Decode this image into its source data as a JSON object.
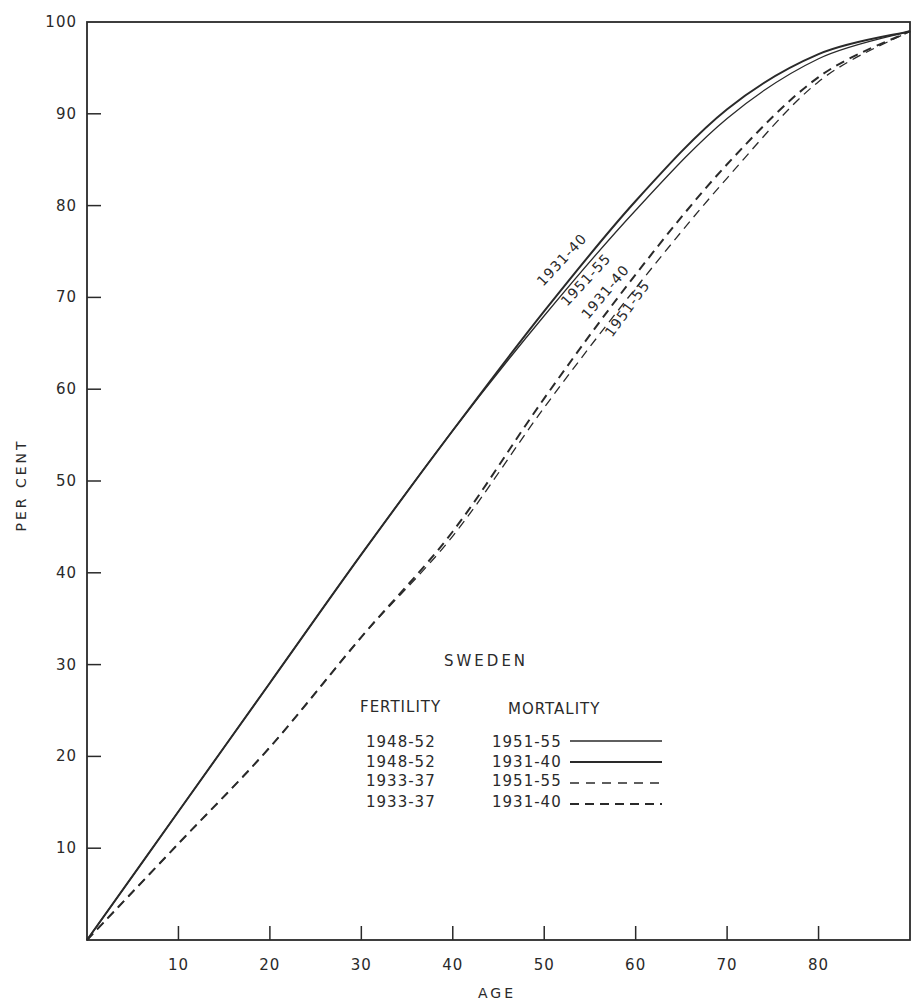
{
  "chart_data": {
    "type": "line",
    "title": "SWEDEN",
    "xlabel": "AGE",
    "ylabel": "PER CENT",
    "xlim": [
      0,
      90
    ],
    "ylim": [
      0,
      100
    ],
    "x_ticks": [
      10,
      20,
      30,
      40,
      50,
      60,
      70,
      80
    ],
    "y_ticks": [
      10,
      20,
      30,
      40,
      50,
      60,
      70,
      80,
      90,
      100
    ],
    "grid": false,
    "legend_position": "lower right inside plot",
    "legend_headers": {
      "fertility": "FERTILITY",
      "mortality": "MORTALITY"
    },
    "x": [
      0,
      10,
      20,
      30,
      40,
      50,
      60,
      70,
      80,
      90
    ],
    "series": [
      {
        "name": "Fertility 1948-52, Mortality 1951-55",
        "fertility": "1948-52",
        "mortality": "1951-55",
        "style": "solid-thin",
        "values": [
          0,
          14,
          28,
          42,
          55.5,
          68,
          79.5,
          89.5,
          96,
          99
        ]
      },
      {
        "name": "Fertility 1948-52, Mortality 1931-40",
        "fertility": "1948-52",
        "mortality": "1931-40",
        "style": "solid-thick",
        "values": [
          0,
          14,
          28,
          42,
          55.5,
          68.5,
          80.5,
          90.5,
          96.5,
          99
        ]
      },
      {
        "name": "Fertility 1933-37, Mortality 1951-55",
        "fertility": "1933-37",
        "mortality": "1951-55",
        "style": "dashed-thin",
        "values": [
          0,
          10.5,
          21,
          33,
          44,
          58,
          71,
          83,
          93.5,
          99
        ]
      },
      {
        "name": "Fertility 1933-37, Mortality 1931-40",
        "fertility": "1933-37",
        "mortality": "1931-40",
        "style": "dashed-thick",
        "values": [
          0,
          10.5,
          21,
          33,
          44.5,
          59,
          72.5,
          84.5,
          94,
          99
        ]
      }
    ],
    "curve_annotations": [
      "1931-40",
      "1951-55",
      "1931-40",
      "1951-55"
    ]
  },
  "legend": {
    "title": "SWEDEN",
    "header_fertility": "FERTILITY",
    "header_mortality": "MORTALITY",
    "rows": [
      {
        "fertility": "1948-52",
        "mortality": "1951-55"
      },
      {
        "fertility": "1948-52",
        "mortality": "1931-40"
      },
      {
        "fertility": "1933-37",
        "mortality": "1951-55"
      },
      {
        "fertility": "1933-37",
        "mortality": "1931-40"
      }
    ]
  },
  "axes": {
    "x_title": "AGE",
    "y_title": "PER CENT"
  },
  "colors": {
    "ink": "#2a2a2a",
    "background": "#ffffff"
  }
}
